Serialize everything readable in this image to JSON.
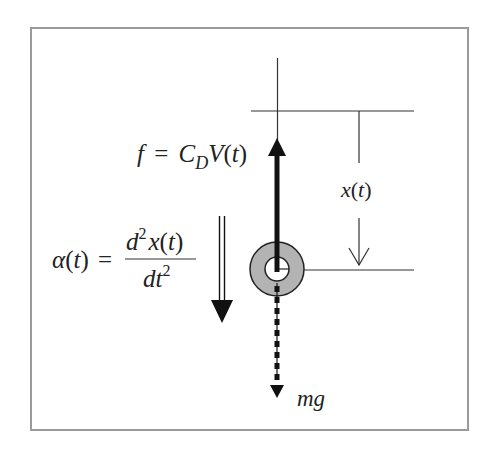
{
  "diagram": {
    "type": "free-body-diagram",
    "colors": {
      "frame": "#9a9a9a",
      "line": "#333333",
      "arrow": "#111111",
      "ring_fill": "#b3b3b3",
      "text": "#222222"
    },
    "labels": {
      "drag_force": {
        "f": "f",
        "equals": "=",
        "C": "C",
        "subscript_D": "D",
        "V": "V",
        "paren_open": "(",
        "t": "t",
        "paren_close": ")"
      },
      "acceleration": {
        "alpha": "α",
        "paren_open": "(",
        "t": "t",
        "paren_close": ")",
        "equals": "=",
        "numerator_d": "d",
        "numerator_sup": "2",
        "numerator_x": "x",
        "numerator_paren_open": "(",
        "numerator_t": "t",
        "numerator_paren_close": ")",
        "denominator_dt": "dt",
        "denominator_sup": "2"
      },
      "displacement": {
        "x": "x",
        "paren_open": "(",
        "t": "t",
        "paren_close": ")"
      },
      "weight": "mg"
    },
    "elements": [
      "reference-line-top",
      "vertical-axis",
      "displacement-dimension",
      "body-ring",
      "drag-force-arrow",
      "gravity-dotted-arrow",
      "acceleration-double-arrow"
    ]
  }
}
